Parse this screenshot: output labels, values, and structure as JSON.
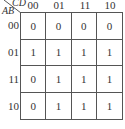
{
  "kmap": {
    "row_variable": "AB",
    "col_variable": "CD",
    "col_headers": [
      "00",
      "01",
      "11",
      "10"
    ],
    "row_headers": [
      "00",
      "01",
      "11",
      "10"
    ],
    "cells": [
      [
        "0",
        "0",
        "0",
        "0"
      ],
      [
        "1",
        "1",
        "1",
        "1"
      ],
      [
        "0",
        "1",
        "1",
        "1"
      ],
      [
        "0",
        "1",
        "1",
        "1"
      ]
    ]
  }
}
